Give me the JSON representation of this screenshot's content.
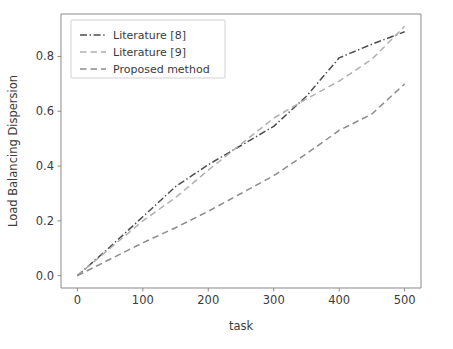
{
  "chart_data": {
    "type": "line",
    "title": "",
    "xlabel": "task",
    "ylabel": "Load Balancing Dispersion",
    "xlim": [
      -25,
      525
    ],
    "ylim": [
      -0.045,
      0.955
    ],
    "xticks": [
      0,
      100,
      200,
      300,
      400,
      500
    ],
    "xtick_labels": [
      "0",
      "100",
      "200",
      "300",
      "400",
      "500"
    ],
    "yticks": [
      0.0,
      0.2,
      0.4,
      0.6,
      0.8
    ],
    "ytick_labels": [
      "0.0",
      "0.2",
      "0.4",
      "0.6",
      "0.8"
    ],
    "grid": false,
    "legend_position": "upper left",
    "x": [
      0,
      50,
      100,
      150,
      200,
      250,
      300,
      350,
      400,
      450,
      500
    ],
    "series": [
      {
        "name": "Literature [8]",
        "linestyle": "dashdot",
        "color": "#4d4d4d",
        "values": [
          0.0,
          0.105,
          0.215,
          0.325,
          0.405,
          0.475,
          0.545,
          0.655,
          0.795,
          0.845,
          0.89
        ]
      },
      {
        "name": "Literature [9]",
        "linestyle": "dashed",
        "color": "#b0b0b0",
        "values": [
          0.0,
          0.1,
          0.2,
          0.285,
          0.385,
          0.48,
          0.575,
          0.645,
          0.71,
          0.79,
          0.91
        ]
      },
      {
        "name": "Proposed method",
        "linestyle": "dashed",
        "color": "#8c8c8c",
        "values": [
          0.0,
          0.06,
          0.12,
          0.175,
          0.235,
          0.3,
          0.365,
          0.445,
          0.53,
          0.59,
          0.7
        ]
      }
    ]
  },
  "legend": {
    "entries": [
      {
        "label": "Literature [8]"
      },
      {
        "label": "Literature [9]"
      },
      {
        "label": "Proposed method"
      }
    ]
  },
  "axes": {
    "xlabel": "task",
    "ylabel": "Load Balancing Dispersion"
  }
}
